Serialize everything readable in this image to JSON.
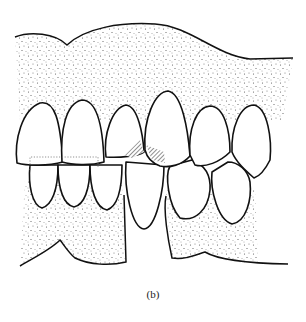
{
  "figure": {
    "caption": "(b)",
    "colors": {
      "line": "#111111",
      "stipple": "#555555",
      "background": "#ffffff"
    },
    "elements": {
      "upper_gum": "stippled upper gingiva",
      "lower_gum_left": "stippled lower gingiva left",
      "lower_gum_right": "stippled lower gingiva right",
      "upper_teeth_count": 6,
      "lower_teeth_count": 6,
      "hatched_regions": 2
    }
  }
}
